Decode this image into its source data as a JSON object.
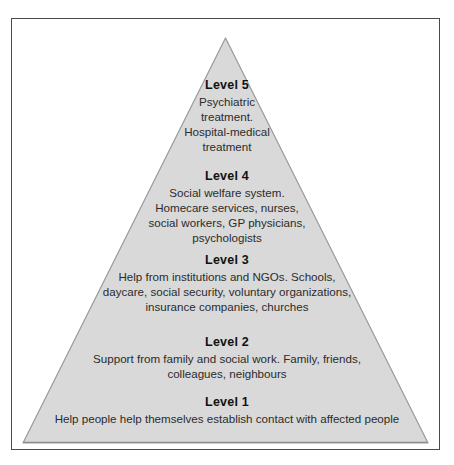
{
  "figure": {
    "type": "pyramid-diagram",
    "level_count": 5,
    "colors": {
      "pyramid_fill": "#d9d9d9",
      "pyramid_stroke": "#9a9a9a",
      "frame_stroke": "#4a4a4a",
      "background": "#ffffff",
      "title_text": "#111111",
      "body_text": "#2b2b2b"
    }
  },
  "levels": [
    {
      "id": "level-5",
      "title": "Level 5",
      "lines": [
        "Psychiatric",
        "treatment.",
        "Hospital-medical",
        "treatment"
      ]
    },
    {
      "id": "level-4",
      "title": "Level 4",
      "lines": [
        "Social welfare system.",
        "Homecare services, nurses,",
        "social workers, GP physicians,",
        "psychologists"
      ]
    },
    {
      "id": "level-3",
      "title": "Level 3",
      "lines": [
        "Help from institutions and NGOs. Schools,",
        "daycare, social security, voluntary organizations,",
        "insurance companies, churches"
      ]
    },
    {
      "id": "level-2",
      "title": "Level 2",
      "lines": [
        "Support from family and social work. Family, friends,",
        "colleagues, neighbours"
      ]
    },
    {
      "id": "level-1",
      "title": "Level 1",
      "lines": [
        "Help people help themselves establish contact with affected people"
      ]
    }
  ]
}
